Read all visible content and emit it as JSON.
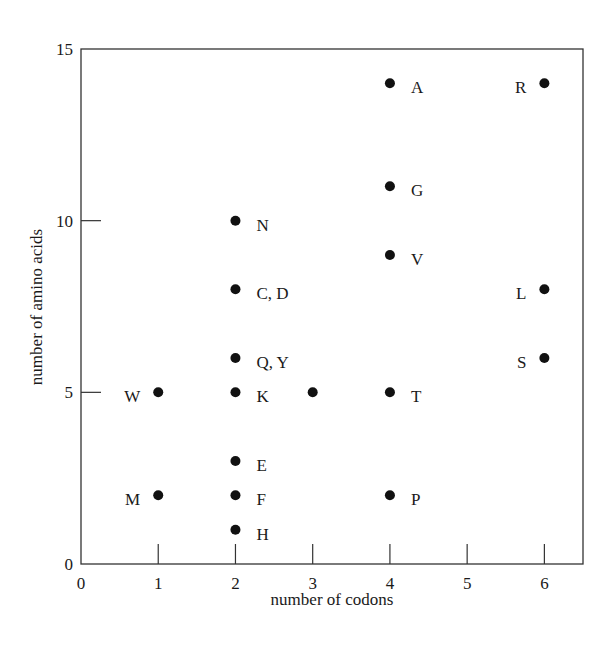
{
  "chart_data": {
    "type": "scatter",
    "title": "",
    "xlabel": "number of codons",
    "ylabel": "number of amino acids",
    "xlim": [
      0,
      6.5
    ],
    "ylim": [
      0,
      15
    ],
    "xticks": [
      0,
      1,
      2,
      3,
      4,
      5,
      6
    ],
    "yticks": [
      0,
      5,
      10,
      15
    ],
    "grid": false,
    "legend": null,
    "marker_color": "#111111",
    "points": [
      {
        "x": 4,
        "y": 14,
        "label": "A",
        "label_side": "right"
      },
      {
        "x": 6,
        "y": 14,
        "label": "R",
        "label_side": "left"
      },
      {
        "x": 4,
        "y": 11,
        "label": "G",
        "label_side": "right"
      },
      {
        "x": 2,
        "y": 10,
        "label": "N",
        "label_side": "right"
      },
      {
        "x": 4,
        "y": 9,
        "label": "V",
        "label_side": "right"
      },
      {
        "x": 2,
        "y": 8,
        "label": "C, D",
        "label_side": "right"
      },
      {
        "x": 6,
        "y": 8,
        "label": "L",
        "label_side": "left"
      },
      {
        "x": 2,
        "y": 6,
        "label": "Q, Y",
        "label_side": "right"
      },
      {
        "x": 6,
        "y": 6,
        "label": "S",
        "label_side": "left"
      },
      {
        "x": 1,
        "y": 5,
        "label": "W",
        "label_side": "left"
      },
      {
        "x": 2,
        "y": 5,
        "label": "K",
        "label_side": "right"
      },
      {
        "x": 3,
        "y": 5,
        "label": "",
        "label_side": "none"
      },
      {
        "x": 4,
        "y": 5,
        "label": "T",
        "label_side": "right"
      },
      {
        "x": 2,
        "y": 3,
        "label": "E",
        "label_side": "right"
      },
      {
        "x": 1,
        "y": 2,
        "label": "M",
        "label_side": "left"
      },
      {
        "x": 2,
        "y": 2,
        "label": "F",
        "label_side": "right"
      },
      {
        "x": 4,
        "y": 2,
        "label": "P",
        "label_side": "right"
      },
      {
        "x": 2,
        "y": 1,
        "label": "H",
        "label_side": "right"
      }
    ]
  }
}
